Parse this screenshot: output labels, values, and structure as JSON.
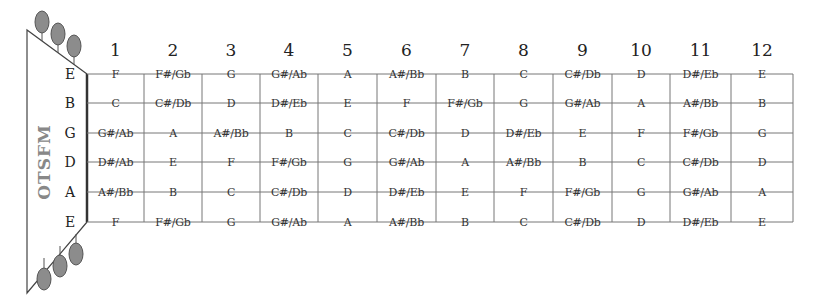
{
  "headstock": {
    "brand": "OTSFM",
    "peg_color": "#8c8c8c"
  },
  "frets": [
    "1",
    "2",
    "3",
    "4",
    "5",
    "6",
    "7",
    "8",
    "9",
    "10",
    "11",
    "12"
  ],
  "strings": [
    {
      "name": "E",
      "notes": [
        "F",
        "F#/Gb",
        "G",
        "G#/Ab",
        "A",
        "A#/Bb",
        "B",
        "C",
        "C#/Db",
        "D",
        "D#/Eb",
        "E"
      ]
    },
    {
      "name": "B",
      "notes": [
        "C",
        "C#/Db",
        "D",
        "D#/Eb",
        "E",
        "F",
        "F#/Gb",
        "G",
        "G#/Ab",
        "A",
        "A#/Bb",
        "B"
      ]
    },
    {
      "name": "G",
      "notes": [
        "G#/Ab",
        "A",
        "A#/Bb",
        "B",
        "C",
        "C#/Db",
        "D",
        "D#/Eb",
        "E",
        "F",
        "F#/Gb",
        "G"
      ]
    },
    {
      "name": "D",
      "notes": [
        "D#/Ab",
        "E",
        "F",
        "F#/Gb",
        "G",
        "G#/Ab",
        "A",
        "A#/Bb",
        "B",
        "C",
        "C#/Db",
        "D"
      ]
    },
    {
      "name": "A",
      "notes": [
        "A#/Bb",
        "B",
        "C",
        "C#/Db",
        "D",
        "D#/Eb",
        "E",
        "F",
        "F#/Gb",
        "G",
        "G#/Ab",
        "A"
      ]
    },
    {
      "name": "E",
      "notes": [
        "F",
        "F#/Gb",
        "G",
        "G#/Ab",
        "A",
        "A#/Bb",
        "B",
        "C",
        "C#/Db",
        "D",
        "D#/Eb",
        "E"
      ]
    }
  ],
  "colors": {
    "line": "#777777",
    "text": "#333333"
  }
}
